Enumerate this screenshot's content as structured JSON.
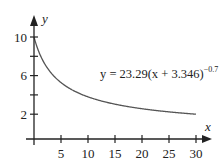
{
  "chart_data": {
    "type": "line",
    "title": "",
    "xlabel": "x",
    "ylabel": "y",
    "xlim": [
      0,
      31
    ],
    "ylim": [
      0,
      12
    ],
    "grid": false,
    "legend": "none",
    "x_ticks": [
      5,
      10,
      15,
      20,
      25,
      30
    ],
    "x_tick_labels": [
      "5",
      "10",
      "15",
      "20",
      "25",
      "30"
    ],
    "y_ticks": [
      2,
      4,
      6,
      8,
      10
    ],
    "y_tick_labels": [
      "2",
      "",
      "6",
      "",
      "10"
    ],
    "annotation": {
      "prefix": "y = 23.29(x + 3.346)",
      "exponent": "−0.7"
    },
    "series": [
      {
        "name": "y = 23.29(x + 3.346)^-0.7",
        "function": "23.29*(x+3.346)^(-0.7)",
        "x": [
          0,
          1,
          2,
          3,
          4,
          5,
          6,
          8,
          10,
          12,
          15,
          18,
          20,
          22,
          25,
          28,
          30
        ],
        "y": [
          10.06,
          8.34,
          7.11,
          6.22,
          5.54,
          5.01,
          4.57,
          3.9,
          3.41,
          3.04,
          2.55,
          2.25,
          2.11,
          1.99,
          1.82,
          1.69,
          1.61
        ]
      }
    ],
    "colors": {
      "curve": "#555555",
      "axes": "#222222"
    }
  }
}
